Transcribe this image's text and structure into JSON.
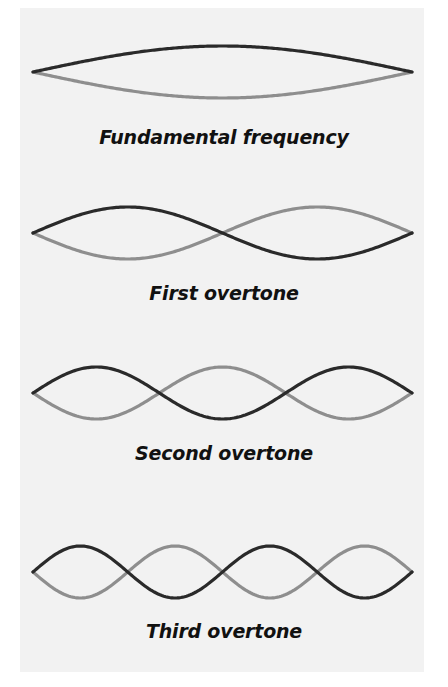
{
  "figure": {
    "background_color": "#f2f2f2",
    "page_color": "#ffffff",
    "colors": {
      "dark_wave": "#2a2a2a",
      "light_wave": "#8e8e8e",
      "text": "#111111"
    },
    "x_start": 33,
    "x_end": 412,
    "amplitude": 26,
    "modes": [
      {
        "label": "Fundamental frequency",
        "loops": 1,
        "center_y": 72,
        "label_top": 126
      },
      {
        "label": "First overtone",
        "loops": 2,
        "center_y": 233,
        "label_top": 282
      },
      {
        "label": "Second overtone",
        "loops": 3,
        "center_y": 393,
        "label_top": 442
      },
      {
        "label": "Third overtone",
        "loops": 4,
        "center_y": 572,
        "label_top": 620
      }
    ]
  }
}
